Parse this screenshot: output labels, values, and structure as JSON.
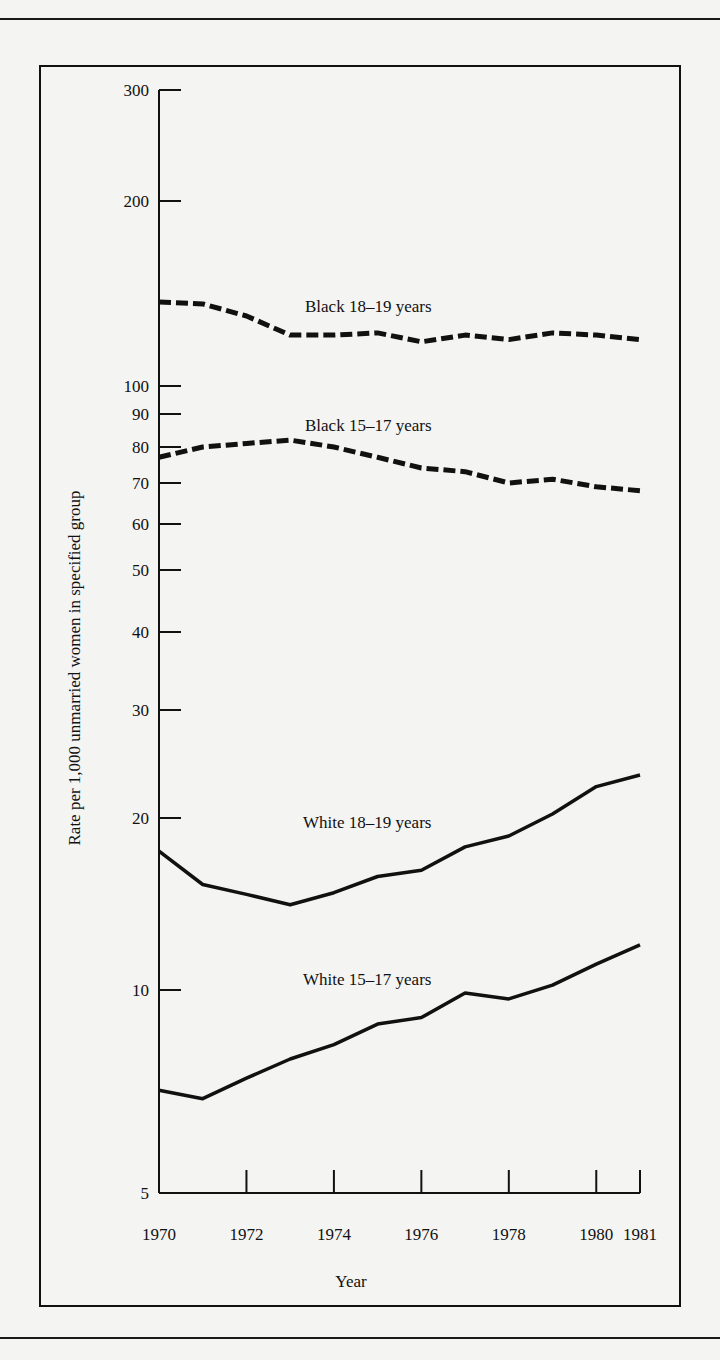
{
  "chart_data": {
    "type": "line",
    "title": "",
    "xlabel": "Year",
    "ylabel": "Rate per 1,000 unmarried women in specified group",
    "yscale": "log",
    "ylim": [
      5,
      300
    ],
    "xlim": [
      1970,
      1981
    ],
    "grid": false,
    "x_ticks": [
      1970,
      1972,
      1974,
      1976,
      1978,
      1980,
      1981
    ],
    "y_ticks": [
      5,
      10,
      20,
      30,
      40,
      50,
      60,
      70,
      80,
      90,
      100,
      200,
      300
    ],
    "x": [
      1970,
      1971,
      1972,
      1973,
      1974,
      1975,
      1976,
      1977,
      1978,
      1979,
      1980,
      1981
    ],
    "series": [
      {
        "name": "Black 18–19 years",
        "style": "dashed",
        "values": [
          137,
          136,
          130,
          121,
          121,
          122,
          118,
          121,
          119,
          122,
          121,
          119
        ]
      },
      {
        "name": "Black 15–17 years",
        "style": "dashed",
        "values": [
          77,
          80,
          81,
          82,
          80,
          77,
          74,
          73,
          70,
          71,
          69,
          68
        ]
      },
      {
        "name": "White 18–19 years",
        "style": "solid",
        "values": [
          17.5,
          15.3,
          14.7,
          14.1,
          14.8,
          15.8,
          16.2,
          17.8,
          18.6,
          20.3,
          22.5,
          23.5
        ]
      },
      {
        "name": "White 15–17 years",
        "style": "solid",
        "values": [
          7.1,
          6.9,
          7.4,
          7.9,
          8.3,
          8.9,
          9.1,
          9.9,
          9.7,
          10.2,
          11.1,
          12.0
        ]
      }
    ],
    "annotations": [
      "Black 18–19 years",
      "Black 15–17 years",
      "White 18–19 years",
      "White 15–17 years"
    ],
    "legend": "inline-labels"
  },
  "labels": {
    "ylabel": "Rate per 1,000 unmarried women in specified group",
    "xlabel": "Year",
    "series_labels": [
      "Black 18–19 years",
      "Black 15–17 years",
      "White 18–19 years",
      "White 15–17 years"
    ]
  },
  "colors": {
    "ink": "#111111",
    "paper": "#f4f4f2"
  }
}
